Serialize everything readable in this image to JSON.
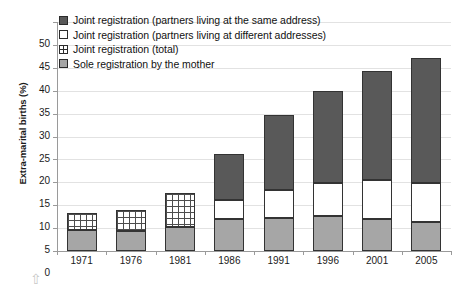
{
  "chart_data": {
    "type": "bar",
    "stacked": true,
    "title": "",
    "xlabel": "",
    "ylabel": "Extra-marital births (%)",
    "ylim": [
      0,
      50
    ],
    "ytick_step": 5,
    "ytick_labels": [
      "0",
      "5",
      "10",
      "15",
      "20",
      "25",
      "30",
      "35",
      "40",
      "45",
      "50"
    ],
    "grid": true,
    "legend_position": "top-left",
    "categories": [
      "1971",
      "1976",
      "1981",
      "1986",
      "1991",
      "1996",
      "2001",
      "2005"
    ],
    "series": [
      {
        "name": "Sole registration by the mother",
        "key": "sole",
        "color": "#a6a6a6",
        "pattern": "solid",
        "values": [
          4.5,
          4.4,
          5.2,
          7.0,
          7.3,
          7.6,
          7.0,
          6.3
        ]
      },
      {
        "name": "Joint registration (partners living at different addresses)",
        "key": "joint_different",
        "color": "#ffffff",
        "pattern": "solid",
        "values": [
          null,
          null,
          null,
          4.2,
          6.0,
          7.2,
          8.5,
          8.5
        ]
      },
      {
        "name": "Joint registration (partners living at the same address)",
        "key": "joint_same",
        "color": "#595959",
        "pattern": "solid",
        "values": [
          null,
          null,
          null,
          10.0,
          16.5,
          20.2,
          23.9,
          27.4
        ]
      },
      {
        "name": "Joint registration (total)",
        "key": "joint_total",
        "color": "#ffffff",
        "pattern": "cross-hatch",
        "values": [
          3.7,
          4.6,
          7.5,
          null,
          null,
          null,
          null,
          null
        ]
      }
    ],
    "totals": [
      8.2,
      9.0,
      12.7,
      21.2,
      29.8,
      35.0,
      39.4,
      42.2
    ],
    "annotations": [
      "up-arrow"
    ]
  },
  "legend": {
    "items": [
      {
        "label": "Joint registration (partners living at the same address)",
        "swatch": "dark"
      },
      {
        "label": "Joint registration (partners living at different addresses)",
        "swatch": "white"
      },
      {
        "label": "Joint registration (total)",
        "swatch": "hatch"
      },
      {
        "label": "Sole registration by the mother",
        "swatch": "light"
      }
    ]
  },
  "axes": {
    "y_title": "Extra-marital births (%)"
  },
  "footer": {
    "arrow_glyph": "⇧"
  }
}
